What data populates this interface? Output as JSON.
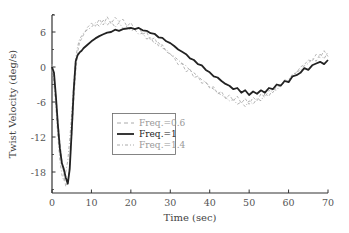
{
  "chart_data": {
    "type": "line",
    "title": "",
    "xlabel": "Time (sec)",
    "ylabel": "Twist Velocity (deg/s)",
    "xlim": [
      0,
      70
    ],
    "ylim": [
      -21.6,
      9
    ],
    "xticks": [
      0,
      10,
      20,
      30,
      40,
      50,
      60,
      70
    ],
    "yticks": [
      6,
      0,
      -6,
      -12,
      -18
    ],
    "grid": false,
    "legend_position": "center-left inside plot",
    "series": [
      {
        "name": "Freq.=0.6",
        "style": "dashed",
        "color": "#b0b0b0",
        "x": [
          0,
          0.5,
          1,
          1.5,
          2,
          2.5,
          3,
          3.5,
          4,
          4.5,
          5,
          5.5,
          6,
          6.5,
          7,
          8,
          9,
          10,
          11,
          12,
          13,
          14,
          15,
          16,
          17,
          18,
          19,
          20,
          21,
          22,
          23,
          24,
          25,
          26,
          27,
          28,
          29,
          30,
          31,
          32,
          33,
          34,
          35,
          36,
          37,
          38,
          39,
          40,
          41,
          42,
          43,
          44,
          45,
          46,
          47,
          48,
          49,
          50,
          51,
          52,
          53,
          54,
          55,
          56,
          57,
          58,
          59,
          60,
          61,
          62,
          63,
          64,
          65,
          66,
          67,
          68,
          69,
          70
        ],
        "values": [
          0.5,
          -2,
          -5,
          -9,
          -13,
          -16,
          -18.5,
          -20.5,
          -19.5,
          -17,
          -12,
          -6,
          -1,
          2.5,
          4.2,
          5.5,
          6.8,
          7.5,
          7,
          8.2,
          7.2,
          8.6,
          7.4,
          8.5,
          7.8,
          8.2,
          7.0,
          7.6,
          6.4,
          6.8,
          5.6,
          6.0,
          4.6,
          5.0,
          3.6,
          3.8,
          2.6,
          2.2,
          1.6,
          0.4,
          0.6,
          -0.8,
          -0.4,
          -1.8,
          -1.6,
          -2.8,
          -2.6,
          -3.6,
          -3.4,
          -4.6,
          -4.2,
          -5.4,
          -4.8,
          -5.8,
          -5.0,
          -6.2,
          -5.4,
          -6.4,
          -5.2,
          -5.8,
          -4.6,
          -5.2,
          -4.0,
          -4.4,
          -3.2,
          -3.4,
          -2.2,
          -2.4,
          -1.2,
          -1.0,
          0.0,
          0.4,
          1.2,
          1.0,
          2.2,
          1.6,
          2.8,
          1.8
        ]
      },
      {
        "name": "Freq.=1",
        "style": "solid",
        "color": "#222222",
        "x": [
          0,
          0.5,
          1,
          1.5,
          2,
          2.5,
          3,
          3.5,
          4,
          4.5,
          5,
          5.5,
          6,
          6.5,
          7,
          7.5,
          8,
          9,
          10,
          11,
          12,
          13,
          14,
          15,
          16,
          17,
          18,
          19,
          20,
          21,
          22,
          23,
          24,
          25,
          26,
          27,
          28,
          29,
          30,
          31,
          32,
          33,
          34,
          35,
          36,
          37,
          38,
          39,
          40,
          41,
          42,
          43,
          44,
          45,
          46,
          47,
          48,
          49,
          50,
          51,
          52,
          53,
          54,
          55,
          56,
          57,
          58,
          59,
          60,
          61,
          62,
          63,
          64,
          65,
          66,
          67,
          68,
          69,
          70
        ],
        "values": [
          0,
          -1,
          -5,
          -10,
          -14,
          -16.5,
          -17.5,
          -19,
          -20,
          -17.5,
          -11,
          -4,
          1.0,
          2.0,
          2.5,
          2.8,
          3.2,
          3.8,
          4.4,
          4.9,
          5.3,
          5.6,
          5.9,
          6.0,
          6.4,
          6.2,
          6.5,
          6.6,
          6.7,
          6.5,
          6.7,
          6.3,
          6.2,
          5.8,
          5.7,
          5.1,
          5.0,
          4.4,
          4.1,
          3.6,
          3.0,
          2.6,
          2.2,
          1.5,
          1.2,
          0.5,
          0.3,
          -0.5,
          -0.9,
          -1.6,
          -1.8,
          -2.4,
          -2.9,
          -3.2,
          -3.8,
          -3.6,
          -4.4,
          -4.0,
          -4.8,
          -4.2,
          -4.6,
          -4.0,
          -4.4,
          -3.6,
          -3.8,
          -3.0,
          -3.2,
          -2.4,
          -2.6,
          -1.6,
          -1.4,
          -1.0,
          -0.2,
          -0.5,
          0.3,
          0.6,
          0.9,
          0.5,
          1.2
        ]
      },
      {
        "name": "Freq.=1.4",
        "style": "dash-dot",
        "color": "#a8a8a8",
        "x": [
          0,
          0.5,
          1,
          1.5,
          2,
          2.5,
          3,
          3.5,
          4,
          4.5,
          5,
          5.5,
          6,
          6.5,
          7,
          8,
          9,
          10,
          11,
          12,
          13,
          14,
          15,
          16,
          17,
          18,
          19,
          20,
          21,
          22,
          23,
          24,
          25,
          26,
          27,
          28,
          29,
          30,
          31,
          32,
          33,
          34,
          35,
          36,
          37,
          38,
          39,
          40,
          41,
          42,
          43,
          44,
          45,
          46,
          47,
          48,
          49,
          50,
          51,
          52,
          53,
          54,
          55,
          56,
          57,
          58,
          59,
          60,
          61,
          62,
          63,
          64,
          65,
          66,
          67,
          68,
          69,
          70
        ],
        "values": [
          -0.5,
          -3,
          -7,
          -12,
          -16,
          -18.5,
          -19.5,
          -18,
          -16,
          -12.5,
          -8,
          -3,
          1.5,
          3.5,
          4.8,
          5.8,
          6.4,
          6.8,
          7.6,
          7.0,
          8.0,
          7.2,
          7.8,
          6.8,
          7.6,
          6.6,
          7.0,
          6.2,
          6.4,
          5.6,
          5.8,
          4.8,
          5.0,
          4.0,
          4.2,
          3.2,
          3.0,
          2.2,
          1.8,
          1.2,
          0.6,
          0.2,
          -0.6,
          -1.0,
          -1.6,
          -2.2,
          -2.6,
          -3.4,
          -3.8,
          -4.4,
          -4.8,
          -5.2,
          -5.8,
          -5.6,
          -6.4,
          -6.0,
          -6.8,
          -5.8,
          -6.4,
          -5.4,
          -5.8,
          -4.6,
          -5.0,
          -3.8,
          -4.0,
          -3.0,
          -2.8,
          -2.0,
          -1.8,
          -0.8,
          -0.6,
          0.2,
          0.6,
          1.4,
          1.0,
          2.2,
          1.4,
          2.6
        ]
      }
    ]
  },
  "axes": {
    "xlabel": "Time (sec)",
    "ylabel": "Twist Velocity (deg/s)",
    "xtick_labels": [
      "0",
      "10",
      "20",
      "30",
      "40",
      "50",
      "60",
      "70"
    ],
    "ytick_labels": [
      "6",
      "0",
      "-6",
      "-12",
      "-18"
    ]
  },
  "legend": {
    "items": [
      {
        "label": "Freq.=0.6",
        "color": "#a0a0a0"
      },
      {
        "label": "Freq.=1",
        "color": "#222222"
      },
      {
        "label": "Freq.=1.4",
        "color": "#a0a0a0"
      }
    ]
  }
}
